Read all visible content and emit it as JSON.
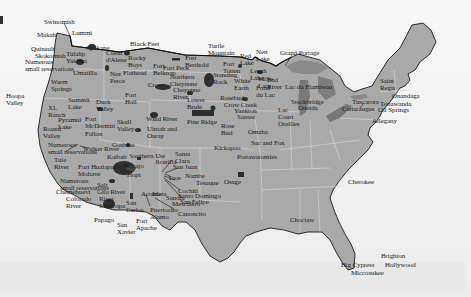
{
  "map": {
    "subject": "Native American reservations in the contiguous United States",
    "colors": {
      "land": "#a9a9a9",
      "water_background": "#f2f2f2",
      "great_lakes": "#7a7a7a",
      "reservation_fill": "#2e2e2e",
      "state_border": "#d8d8d8",
      "coast_border": "#1a1a1a",
      "label_text": "#1c1c1c"
    },
    "labels": [
      {
        "id": "swinomish",
        "text": "Swinomish",
        "x": 44,
        "y": 19
      },
      {
        "id": "lummi",
        "text": "Lummi",
        "x": 72,
        "y": 30
      },
      {
        "id": "makah",
        "text": "Makah",
        "x": 37,
        "y": 32
      },
      {
        "id": "quinault",
        "text": "Quinault",
        "x": 31,
        "y": 46
      },
      {
        "id": "skokomish",
        "text": "Skokomish",
        "x": 35,
        "y": 53
      },
      {
        "id": "numerous-sr-nw",
        "text": "Numerous\nsmall reservations",
        "x": 25,
        "y": 59
      },
      {
        "id": "tulalip",
        "text": "Tulalip",
        "x": 66,
        "y": 51
      },
      {
        "id": "yakima",
        "text": "Yakima",
        "x": 66,
        "y": 58
      },
      {
        "id": "spokane",
        "text": "Spokane",
        "x": 86,
        "y": 45
      },
      {
        "id": "coeur-dalene",
        "text": "Coeur\nd'Alene",
        "x": 106,
        "y": 50
      },
      {
        "id": "black-feet",
        "text": "Black Feet",
        "x": 130,
        "y": 41
      },
      {
        "id": "rocky-boys",
        "text": "Rocky\nBoys",
        "x": 128,
        "y": 55
      },
      {
        "id": "flathead",
        "text": "Flathead",
        "x": 123,
        "y": 70
      },
      {
        "id": "fort-belknap",
        "text": "Fort\nBelknap",
        "x": 153,
        "y": 63
      },
      {
        "id": "fort-peck",
        "text": "Fort Peck",
        "x": 163,
        "y": 65
      },
      {
        "id": "fort-berthold",
        "text": "Fort\nBerthold",
        "x": 185,
        "y": 55
      },
      {
        "id": "umatilla",
        "text": "Umatilla",
        "x": 73,
        "y": 70
      },
      {
        "id": "nez-perce",
        "text": "Nez\nPerce",
        "x": 110,
        "y": 71
      },
      {
        "id": "crow",
        "text": "Crow",
        "x": 148,
        "y": 82
      },
      {
        "id": "northern-cheyenne",
        "text": "Northern\nCheyenne",
        "x": 170,
        "y": 74
      },
      {
        "id": "cheyenne-river",
        "text": "Cheyenne\nRiver",
        "x": 173,
        "y": 87
      },
      {
        "id": "warm-springs",
        "text": "Warm\nSprings",
        "x": 51,
        "y": 79
      },
      {
        "id": "hoopa-valley",
        "text": "Hoopa\nValley",
        "x": 6,
        "y": 93
      },
      {
        "id": "summit-lake",
        "text": "Summit\nLake",
        "x": 68,
        "y": 97
      },
      {
        "id": "duck-valley",
        "text": "Duck\nValley",
        "x": 96,
        "y": 99
      },
      {
        "id": "fort-hall",
        "text": "Fort\nHall",
        "x": 125,
        "y": 92
      },
      {
        "id": "turtle-mountain",
        "text": "Turtle\nMountain",
        "x": 208,
        "y": 43
      },
      {
        "id": "red-lake",
        "text": "Red\nLake",
        "x": 240,
        "y": 53
      },
      {
        "id": "nett-lake",
        "text": "Nett\nLake",
        "x": 256,
        "y": 49
      },
      {
        "id": "grand-portage",
        "text": "Grand Portage",
        "x": 280,
        "y": 50
      },
      {
        "id": "fort-totten",
        "text": "Fort\nTotten",
        "x": 223,
        "y": 61
      },
      {
        "id": "standing-rock",
        "text": "Standing\nRock",
        "x": 213,
        "y": 72
      },
      {
        "id": "white-earth",
        "text": "White\nEarth",
        "x": 234,
        "y": 78
      },
      {
        "id": "leech-lake",
        "text": "Leech\nLake",
        "x": 250,
        "y": 68
      },
      {
        "id": "mille-lacs",
        "text": "Mille\nLacs",
        "x": 258,
        "y": 76
      },
      {
        "id": "fond-du-lac",
        "text": "Fond\ndu Lac",
        "x": 256,
        "y": 85
      },
      {
        "id": "bad-river",
        "text": "Bad\nRiver",
        "x": 267,
        "y": 77
      },
      {
        "id": "lac-du-flambeau",
        "text": "Lac du Flambeau",
        "x": 285,
        "y": 84
      },
      {
        "id": "stockbridge",
        "text": "Stockbridge",
        "x": 291,
        "y": 99
      },
      {
        "id": "oneida",
        "text": "Oneida",
        "x": 298,
        "y": 105
      },
      {
        "id": "lac-courte-oreilles",
        "text": "Lac\nCourt\nOreilles",
        "x": 278,
        "y": 107
      },
      {
        "id": "lower-brule",
        "text": "Lower\nBrule",
        "x": 187,
        "y": 97
      },
      {
        "id": "rosebud",
        "text": "Rosebud",
        "x": 220,
        "y": 95
      },
      {
        "id": "crow-creek",
        "text": "Crow Creek",
        "x": 224,
        "y": 102
      },
      {
        "id": "yankton",
        "text": "Yankton",
        "x": 234,
        "y": 108
      },
      {
        "id": "santee",
        "text": "Santee",
        "x": 237,
        "y": 114
      },
      {
        "id": "wind-river",
        "text": "Wind River",
        "x": 146,
        "y": 116
      },
      {
        "id": "pine-ridge",
        "text": "Pine Ridge",
        "x": 187,
        "y": 119
      },
      {
        "id": "rose-bud-2",
        "text": "Rose\nBud",
        "x": 221,
        "y": 123
      },
      {
        "id": "omaha",
        "text": "Omaha",
        "x": 248,
        "y": 129
      },
      {
        "id": "sac-and-fox",
        "text": "Sac and Fox",
        "x": 251,
        "y": 140
      },
      {
        "id": "saint-regis",
        "text": "Saint\nRegis",
        "x": 380,
        "y": 78
      },
      {
        "id": "onandaga",
        "text": "Onandaga",
        "x": 392,
        "y": 93
      },
      {
        "id": "tuscarora",
        "text": "Tuscarora",
        "x": 352,
        "y": 99
      },
      {
        "id": "tonawanda",
        "text": "Tonawanda",
        "x": 380,
        "y": 101
      },
      {
        "id": "cattaraugus",
        "text": "Cattaraugus",
        "x": 342,
        "y": 106
      },
      {
        "id": "oil-springs",
        "text": "Oil Springs",
        "x": 378,
        "y": 107
      },
      {
        "id": "allegany",
        "text": "Allegany",
        "x": 372,
        "y": 118
      },
      {
        "id": "xl-ranch",
        "text": "XL\nRanch",
        "x": 48,
        "y": 105
      },
      {
        "id": "pyramid-lake",
        "text": "Pyramid\nLake",
        "x": 58,
        "y": 117
      },
      {
        "id": "fort-mcdermitt",
        "text": "Fort\nMcDermitt",
        "x": 85,
        "y": 116
      },
      {
        "id": "round-valley",
        "text": "Round\nValley",
        "x": 43,
        "y": 126
      },
      {
        "id": "fallon",
        "text": "Fallon",
        "x": 85,
        "y": 131
      },
      {
        "id": "skull-valley",
        "text": "Skull\nValley",
        "x": 117,
        "y": 119
      },
      {
        "id": "uintah-and-ouray",
        "text": "Uintah and\nOuray",
        "x": 147,
        "y": 126
      },
      {
        "id": "goshute",
        "text": "Goshute",
        "x": 112,
        "y": 142
      },
      {
        "id": "numerous-sr-ca",
        "text": "Numerous\nsmall reservations",
        "x": 48,
        "y": 142
      },
      {
        "id": "walker-river",
        "text": "Walker River",
        "x": 83,
        "y": 146
      },
      {
        "id": "kaibab",
        "text": "Kaibab",
        "x": 107,
        "y": 154
      },
      {
        "id": "southern-ute",
        "text": "Southern Ute",
        "x": 129,
        "y": 153
      },
      {
        "id": "tule-river",
        "text": "Tule\nRiver",
        "x": 54,
        "y": 157
      },
      {
        "id": "santa-clara",
        "text": "Santa\nClara",
        "x": 175,
        "y": 151
      },
      {
        "id": "jicarilla",
        "text": "Jicarilla",
        "x": 155,
        "y": 159
      },
      {
        "id": "san-juan",
        "text": "San Juan",
        "x": 173,
        "y": 164
      },
      {
        "id": "fort-huachuca-mohave",
        "text": "Fort Hualapai\nMohave",
        "x": 78,
        "y": 164
      },
      {
        "id": "navajo",
        "text": "Navajo",
        "x": 124,
        "y": 163
      },
      {
        "id": "hopi",
        "text": "Hopi",
        "x": 127,
        "y": 172
      },
      {
        "id": "taos",
        "text": "Taos",
        "x": 168,
        "y": 175
      },
      {
        "id": "nambe",
        "text": "Nambe",
        "x": 185,
        "y": 173
      },
      {
        "id": "tesuque",
        "text": "Tesuque",
        "x": 196,
        "y": 180
      },
      {
        "id": "numerous-sr-sw",
        "text": "Numerous\nsmall reservations",
        "x": 60,
        "y": 178
      },
      {
        "id": "salt",
        "text": "Salt",
        "x": 97,
        "y": 182
      },
      {
        "id": "cochiti",
        "text": "Cochiti",
        "x": 178,
        "y": 188
      },
      {
        "id": "santo-domingo",
        "text": "Santo Domingo",
        "x": 178,
        "y": 193
      },
      {
        "id": "san-felipe",
        "text": "San Felipe",
        "x": 180,
        "y": 199
      },
      {
        "id": "chemehuevi",
        "text": "Chemehuevi",
        "x": 56,
        "y": 189
      },
      {
        "id": "colorado-river",
        "text": "Colorado\nRiver",
        "x": 66,
        "y": 196
      },
      {
        "id": "gila-river",
        "text": "Gila River",
        "x": 97,
        "y": 189
      },
      {
        "id": "river-maricopa",
        "text": "River\nMaricopa",
        "x": 99,
        "y": 196
      },
      {
        "id": "acoma",
        "text": "Acoma",
        "x": 141,
        "y": 191
      },
      {
        "id": "isleta",
        "text": "Isleta",
        "x": 152,
        "y": 191
      },
      {
        "id": "sandia",
        "text": "Sandia",
        "x": 166,
        "y": 195
      },
      {
        "id": "mescalero",
        "text": "Mescalero",
        "x": 172,
        "y": 201
      },
      {
        "id": "san-carlos",
        "text": "San\nCarlos",
        "x": 126,
        "y": 200
      },
      {
        "id": "puertocito-alamo",
        "text": "Puertocito\nAlamo",
        "x": 150,
        "y": 207
      },
      {
        "id": "canoncito",
        "text": "Canoncito",
        "x": 178,
        "y": 211
      },
      {
        "id": "papago",
        "text": "Papago",
        "x": 94,
        "y": 217
      },
      {
        "id": "fort-apache",
        "text": "Fort\nApache",
        "x": 136,
        "y": 218
      },
      {
        "id": "san-xavier",
        "text": "San\nXavier",
        "x": 117,
        "y": 222
      },
      {
        "id": "kickapoo",
        "text": "Kickapoo",
        "x": 214,
        "y": 145
      },
      {
        "id": "pottawatomies",
        "text": "Pottawatomies",
        "x": 237,
        "y": 154
      },
      {
        "id": "osage",
        "text": "Osage",
        "x": 224,
        "y": 179
      },
      {
        "id": "choctaw",
        "text": "Choctaw",
        "x": 290,
        "y": 217
      },
      {
        "id": "cherokee",
        "text": "Cherokee",
        "x": 348,
        "y": 179
      },
      {
        "id": "brighton",
        "text": "Brighton",
        "x": 381,
        "y": 253
      },
      {
        "id": "big-cypress",
        "text": "Big Cypress",
        "x": 341,
        "y": 262
      },
      {
        "id": "hollywood",
        "text": "Hollywood",
        "x": 385,
        "y": 262
      },
      {
        "id": "miccosukee",
        "text": "Miccosukee",
        "x": 351,
        "y": 270
      }
    ]
  }
}
